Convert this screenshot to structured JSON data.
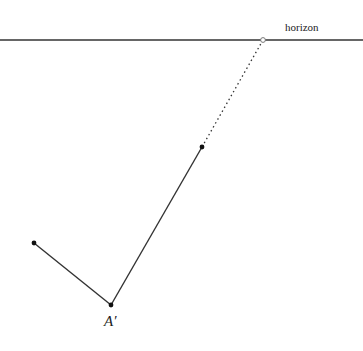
{
  "diagram": {
    "horizon": {
      "label": "horizon",
      "y": 40,
      "x1": 0,
      "x2": 363,
      "color": "#333333"
    },
    "vanishing_point": {
      "x": 263,
      "y": 40
    },
    "points": [
      {
        "id": "A_prime",
        "label": "A′",
        "x": 111,
        "y": 305
      },
      {
        "id": "left_end",
        "label": "",
        "x": 34,
        "y": 243
      },
      {
        "id": "upper_end",
        "label": "",
        "x": 202,
        "y": 147
      }
    ],
    "segments": [
      {
        "from": "left_end",
        "to": "A_prime",
        "style": "solid"
      },
      {
        "from": "A_prime",
        "to": "upper_end",
        "style": "solid"
      },
      {
        "from": "upper_end",
        "to": "vanishing_point",
        "style": "dotted"
      }
    ],
    "colors": {
      "line": "#333333",
      "point": "#111111",
      "background": "#ffffff"
    }
  }
}
